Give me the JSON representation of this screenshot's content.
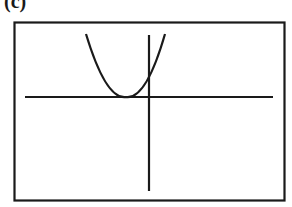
{
  "figure": {
    "label": "(c)",
    "colors": {
      "stroke": "#1a1a1a",
      "background": "#ffffff"
    }
  },
  "graph": {
    "frame": {
      "x": 14,
      "y": 22,
      "width": 271,
      "height": 179
    },
    "x_axis": {
      "y": 97,
      "x1": 25,
      "x2": 273
    },
    "y_axis": {
      "x": 149,
      "y1": 35,
      "y2": 191
    },
    "parabola": {
      "vertex": {
        "x": 126,
        "y": 97
      },
      "left_end": {
        "x": 86,
        "y": 34
      },
      "right_end": {
        "x": 165,
        "y": 34
      },
      "opens": "up",
      "touches_x_axis": true
    }
  }
}
